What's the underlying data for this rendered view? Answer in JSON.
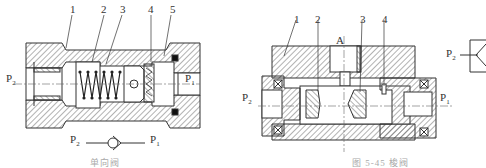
{
  "figure_left": {
    "title": "Check valve",
    "part_labels": [
      "1",
      "2",
      "3",
      "4",
      "5"
    ],
    "ports": {
      "left": "P",
      "left_sub": "2",
      "right": "P",
      "right_sub": "1"
    },
    "symbol_ports": {
      "left": "P",
      "left_sub": "2",
      "right": "P",
      "right_sub": "1"
    },
    "caption": "单向阀"
  },
  "figure_right": {
    "title": "Shuttle valve",
    "part_labels": [
      "1",
      "2",
      "3",
      "4"
    ],
    "top_port": "A",
    "ports": {
      "left": "P",
      "left_sub": "2",
      "right": "P",
      "right_sub": "1"
    },
    "caption": "图 5-45   梭阀"
  },
  "symbol_right": {
    "port": "P",
    "port_sub": "2"
  },
  "colors": {
    "line": "#333333",
    "hatch": "#555555",
    "background": "#ffffff"
  }
}
